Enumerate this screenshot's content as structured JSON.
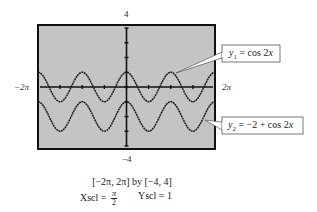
{
  "chart_data": {
    "type": "line",
    "title": "",
    "xlabel": "",
    "ylabel": "",
    "xlim": [
      "-2π",
      "2π"
    ],
    "xlim_numeric": [
      -6.2832,
      6.2832
    ],
    "ylim": [
      -4,
      4
    ],
    "grid": false,
    "background": "#c4c4c4",
    "axis_labels": {
      "top": "4",
      "bottom": "−4",
      "left": "−2π",
      "right": "2π"
    },
    "series": [
      {
        "name": "y1 = cos 2x",
        "expression": "cos(2x)",
        "x": [
          -6.2832,
          -4.7124,
          -3.1416,
          -1.5708,
          0,
          1.5708,
          3.1416,
          4.7124,
          6.2832
        ],
        "values": [
          1,
          -1,
          1,
          -1,
          1,
          -1,
          1,
          -1,
          1
        ]
      },
      {
        "name": "y2 = −2 + cos 2x",
        "expression": "-2 + cos(2x)",
        "x": [
          -6.2832,
          -4.7124,
          -3.1416,
          -1.5708,
          0,
          1.5708,
          3.1416,
          4.7124,
          6.2832
        ],
        "values": [
          -1,
          -3,
          -1,
          -3,
          -1,
          -3,
          -1,
          -3,
          -1
        ]
      }
    ],
    "annotations": [
      {
        "text": "y1 = cos 2x",
        "target_series": 0
      },
      {
        "text": "y2 = −2 + cos 2x",
        "target_series": 1
      }
    ],
    "window": "[−2π, 2π] by [−4, 4]",
    "xscl": "π/2",
    "yscl": "1"
  },
  "labels": {
    "ymax": "4",
    "ymin": "−4",
    "xmin": "−2π",
    "xmax": "2π"
  },
  "callouts": {
    "y1": {
      "prefix": "y",
      "sub": "1",
      "rest": " = cos 2",
      "var": "x"
    },
    "y2": {
      "prefix": "y",
      "sub": "2",
      "rest": " = −2 + cos 2",
      "var": "x"
    }
  },
  "window": {
    "text": "[−2π, 2π]  by  [−4, 4]",
    "xscl_label": "Xscl = ",
    "xscl_num": "π",
    "xscl_den": "2",
    "yscl_text": "Yscl = 1"
  }
}
